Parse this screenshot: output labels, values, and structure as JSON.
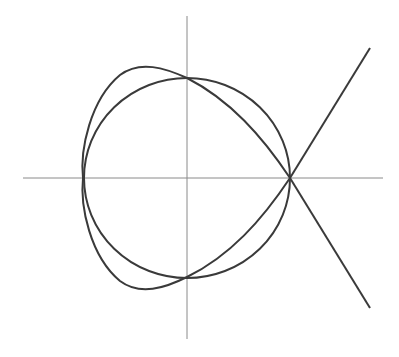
{
  "diagram": {
    "type": "math-curves",
    "colors": {
      "background": "#ffffff",
      "axes": "#8a8a8a",
      "curves": "#3a3a3a"
    },
    "axes": {
      "x_axis": {
        "from": [
          23,
          178
        ],
        "to": [
          383,
          178
        ]
      },
      "y_axis": {
        "from": [
          187,
          16
        ],
        "to": [
          187,
          339
        ]
      }
    },
    "circle": {
      "center": [
        187,
        178
      ],
      "rx": 103,
      "ry": 100
    },
    "strophoid": {
      "node": [
        290,
        178
      ],
      "leftmost": [
        83,
        178
      ],
      "upper_branch_end": [
        370,
        48
      ],
      "lower_branch_end": [
        370,
        308
      ]
    }
  }
}
